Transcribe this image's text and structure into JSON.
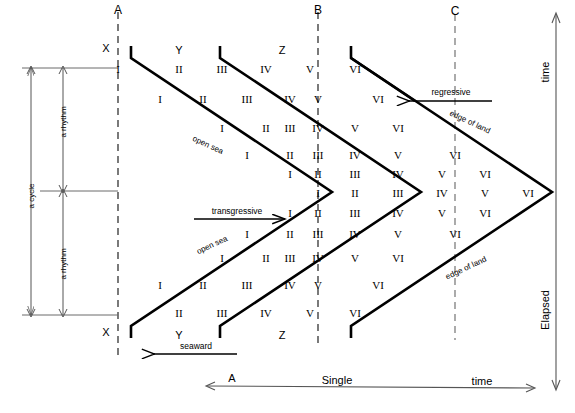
{
  "figure": {
    "type": "stratigraphic-time-diagram",
    "width": 575,
    "height": 413,
    "stroke_color": "#000000",
    "thin_stroke_color": "#3a3a3a"
  },
  "vertical_sections": {
    "labels": [
      "A",
      "B",
      "C"
    ],
    "A": {
      "label": "A",
      "x": 118,
      "top_label": "X",
      "top_numeral": "I",
      "bottom_numeral": "I",
      "bottom_label": "X"
    },
    "B": {
      "label": "B",
      "x": 318
    },
    "C": {
      "label": "C",
      "x": 455
    }
  },
  "surface_markers": {
    "top": [
      "X",
      "Y",
      "Z"
    ],
    "bottom": [
      "X",
      "Y",
      "Z"
    ]
  },
  "arrows": {
    "regressive": "regressive",
    "transgressive": "transgressive",
    "seaward": "seaward"
  },
  "facies_labels": {
    "open_sea": "open sea",
    "edge_of_land": "edge of land"
  },
  "brackets": {
    "cycle": "a cycle",
    "rhythm_upper": "a rhythm",
    "rhythm_lower": "a rhythm"
  },
  "axes": {
    "bottom": {
      "left_label": "A",
      "center_label": "Single",
      "right_label": "time",
      "full_text": "A Single time"
    },
    "right": {
      "top_label": "time",
      "bottom_label": "Elapsed",
      "full_text": "Elapsed time"
    }
  },
  "numeral_columns": {
    "x_positions": [
      118,
      179,
      222,
      266,
      310,
      355,
      398,
      442,
      485,
      528
    ],
    "values": [
      "I",
      "II",
      "III",
      "IV",
      "V",
      "VI"
    ]
  },
  "chart_data": {
    "type": "diagram",
    "rows": [
      {
        "y": 69,
        "cells": [
          {
            "x": 118,
            "v": "I"
          },
          {
            "x": 179,
            "v": "II"
          },
          {
            "x": 222,
            "v": "III"
          },
          {
            "x": 266,
            "v": "IV"
          },
          {
            "x": 310,
            "v": "V"
          },
          {
            "x": 318,
            "v": "VI",
            "on_line": "B"
          }
        ]
      },
      {
        "y": 99,
        "cells": [
          {
            "x": 160,
            "v": "I"
          },
          {
            "x": 203,
            "v": "II"
          },
          {
            "x": 247,
            "v": "III"
          },
          {
            "x": 290,
            "v": "IV"
          },
          {
            "x": 318,
            "v": "V"
          },
          {
            "x": 378,
            "v": "VI"
          }
        ]
      },
      {
        "y": 128,
        "cells": [
          {
            "x": 222,
            "v": "I"
          },
          {
            "x": 266,
            "v": "II"
          },
          {
            "x": 290,
            "v": "III"
          },
          {
            "x": 318,
            "v": "IV"
          },
          {
            "x": 355,
            "v": "V"
          },
          {
            "x": 398,
            "v": "VI"
          }
        ]
      },
      {
        "y": 155,
        "cells": [
          {
            "x": 247,
            "v": "I"
          },
          {
            "x": 290,
            "v": "II"
          },
          {
            "x": 318,
            "v": "III"
          },
          {
            "x": 355,
            "v": "IV"
          },
          {
            "x": 398,
            "v": "V"
          },
          {
            "x": 455,
            "v": "VI"
          }
        ]
      },
      {
        "y": 174,
        "cells": [
          {
            "x": 290,
            "v": "I"
          },
          {
            "x": 318,
            "v": "II"
          },
          {
            "x": 355,
            "v": "III"
          },
          {
            "x": 398,
            "v": "IV"
          },
          {
            "x": 442,
            "v": "V"
          },
          {
            "x": 485,
            "v": "VI"
          }
        ]
      },
      {
        "y": 193,
        "cells": [
          {
            "x": 318,
            "v": "I"
          },
          {
            "x": 355,
            "v": "II"
          },
          {
            "x": 398,
            "v": "III"
          },
          {
            "x": 442,
            "v": "IV"
          },
          {
            "x": 485,
            "v": "V"
          },
          {
            "x": 528,
            "v": "VI"
          }
        ]
      },
      {
        "y": 213,
        "cells": [
          {
            "x": 290,
            "v": "I"
          },
          {
            "x": 318,
            "v": "II"
          },
          {
            "x": 355,
            "v": "III"
          },
          {
            "x": 398,
            "v": "IV"
          },
          {
            "x": 442,
            "v": "V"
          },
          {
            "x": 485,
            "v": "VI"
          }
        ]
      },
      {
        "y": 234,
        "cells": [
          {
            "x": 247,
            "v": "I"
          },
          {
            "x": 290,
            "v": "II"
          },
          {
            "x": 318,
            "v": "III"
          },
          {
            "x": 355,
            "v": "IV"
          },
          {
            "x": 398,
            "v": "V"
          },
          {
            "x": 455,
            "v": "VI"
          }
        ]
      },
      {
        "y": 258,
        "cells": [
          {
            "x": 222,
            "v": "I"
          },
          {
            "x": 266,
            "v": "II"
          },
          {
            "x": 290,
            "v": "III"
          },
          {
            "x": 318,
            "v": "IV"
          },
          {
            "x": 355,
            "v": "V"
          },
          {
            "x": 398,
            "v": "VI"
          }
        ]
      },
      {
        "y": 285,
        "cells": [
          {
            "x": 160,
            "v": "I"
          },
          {
            "x": 203,
            "v": "II"
          },
          {
            "x": 247,
            "v": "III"
          },
          {
            "x": 290,
            "v": "IV"
          },
          {
            "x": 318,
            "v": "V"
          },
          {
            "x": 378,
            "v": "VI"
          }
        ]
      },
      {
        "y": 313,
        "cells": [
          {
            "x": 118,
            "v": "I"
          },
          {
            "x": 179,
            "v": "II"
          },
          {
            "x": 222,
            "v": "III"
          },
          {
            "x": 266,
            "v": "IV"
          },
          {
            "x": 310,
            "v": "V"
          },
          {
            "x": 318,
            "v": "VI",
            "on_line": "B"
          }
        ]
      }
    ]
  },
  "numerals": [
    {
      "x": 118,
      "y": 69,
      "v": "I"
    },
    {
      "x": 179,
      "y": 69,
      "v": "II"
    },
    {
      "x": 222,
      "y": 69,
      "v": "III"
    },
    {
      "x": 266,
      "y": 69,
      "v": "IV"
    },
    {
      "x": 310,
      "y": 69,
      "v": "V"
    },
    {
      "x": 355,
      "y": 69,
      "v": "VI"
    },
    {
      "x": 160,
      "y": 99,
      "v": "I"
    },
    {
      "x": 203,
      "y": 99,
      "v": "II"
    },
    {
      "x": 247,
      "y": 99,
      "v": "III"
    },
    {
      "x": 290,
      "y": 99,
      "v": "IV"
    },
    {
      "x": 318,
      "y": 99,
      "v": "V"
    },
    {
      "x": 378,
      "y": 99,
      "v": "VI"
    },
    {
      "x": 222,
      "y": 128,
      "v": "I"
    },
    {
      "x": 266,
      "y": 128,
      "v": "II"
    },
    {
      "x": 290,
      "y": 128,
      "v": "III"
    },
    {
      "x": 318,
      "y": 128,
      "v": "IV"
    },
    {
      "x": 355,
      "y": 128,
      "v": "V"
    },
    {
      "x": 398,
      "y": 128,
      "v": "VI"
    },
    {
      "x": 247,
      "y": 155,
      "v": "I"
    },
    {
      "x": 290,
      "y": 155,
      "v": "II"
    },
    {
      "x": 318,
      "y": 155,
      "v": "III"
    },
    {
      "x": 355,
      "y": 155,
      "v": "IV"
    },
    {
      "x": 398,
      "y": 155,
      "v": "V"
    },
    {
      "x": 455,
      "y": 155,
      "v": "VI"
    },
    {
      "x": 290,
      "y": 174,
      "v": "I"
    },
    {
      "x": 318,
      "y": 174,
      "v": "II"
    },
    {
      "x": 355,
      "y": 174,
      "v": "III"
    },
    {
      "x": 398,
      "y": 174,
      "v": "IV"
    },
    {
      "x": 442,
      "y": 174,
      "v": "V"
    },
    {
      "x": 485,
      "y": 174,
      "v": "VI"
    },
    {
      "x": 318,
      "y": 193,
      "v": "I"
    },
    {
      "x": 355,
      "y": 193,
      "v": "II"
    },
    {
      "x": 398,
      "y": 193,
      "v": "III"
    },
    {
      "x": 442,
      "y": 193,
      "v": "IV"
    },
    {
      "x": 485,
      "y": 193,
      "v": "V"
    },
    {
      "x": 528,
      "y": 193,
      "v": "VI"
    },
    {
      "x": 290,
      "y": 213,
      "v": "I"
    },
    {
      "x": 318,
      "y": 213,
      "v": "II"
    },
    {
      "x": 355,
      "y": 213,
      "v": "III"
    },
    {
      "x": 398,
      "y": 213,
      "v": "IV"
    },
    {
      "x": 442,
      "y": 213,
      "v": "V"
    },
    {
      "x": 485,
      "y": 213,
      "v": "VI"
    },
    {
      "x": 247,
      "y": 234,
      "v": "I"
    },
    {
      "x": 290,
      "y": 234,
      "v": "II"
    },
    {
      "x": 318,
      "y": 234,
      "v": "III"
    },
    {
      "x": 355,
      "y": 234,
      "v": "IV"
    },
    {
      "x": 398,
      "y": 234,
      "v": "V"
    },
    {
      "x": 455,
      "y": 234,
      "v": "VI"
    },
    {
      "x": 222,
      "y": 258,
      "v": "I"
    },
    {
      "x": 266,
      "y": 258,
      "v": "II"
    },
    {
      "x": 290,
      "y": 258,
      "v": "III"
    },
    {
      "x": 318,
      "y": 258,
      "v": "IV"
    },
    {
      "x": 355,
      "y": 258,
      "v": "V"
    },
    {
      "x": 398,
      "y": 258,
      "v": "VI"
    },
    {
      "x": 160,
      "y": 285,
      "v": "I"
    },
    {
      "x": 203,
      "y": 285,
      "v": "II"
    },
    {
      "x": 247,
      "y": 285,
      "v": "III"
    },
    {
      "x": 290,
      "y": 285,
      "v": "IV"
    },
    {
      "x": 318,
      "y": 285,
      "v": "V"
    },
    {
      "x": 378,
      "y": 285,
      "v": "VI"
    },
    {
      "x": 179,
      "y": 313,
      "v": "II"
    },
    {
      "x": 222,
      "y": 313,
      "v": "III"
    },
    {
      "x": 266,
      "y": 313,
      "v": "IV"
    },
    {
      "x": 310,
      "y": 313,
      "v": "V"
    },
    {
      "x": 355,
      "y": 313,
      "v": "VI"
    }
  ]
}
